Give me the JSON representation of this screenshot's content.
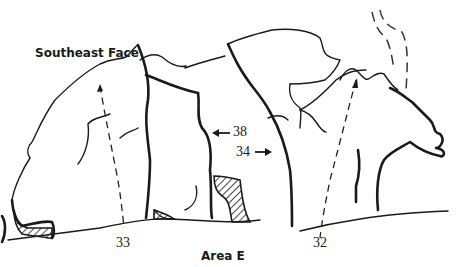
{
  "diagram": {
    "type": "climbing-topo",
    "title": "Southeast Face",
    "caption": "Area E",
    "colors": {
      "ink": "#1a1a1a",
      "background": "#ffffff"
    },
    "routes": [
      {
        "number": "33",
        "style": "dashed-line"
      },
      {
        "number": "38",
        "style": "arrow"
      },
      {
        "number": "34",
        "style": "arrow"
      },
      {
        "number": "32",
        "style": "dashed-line"
      }
    ]
  }
}
